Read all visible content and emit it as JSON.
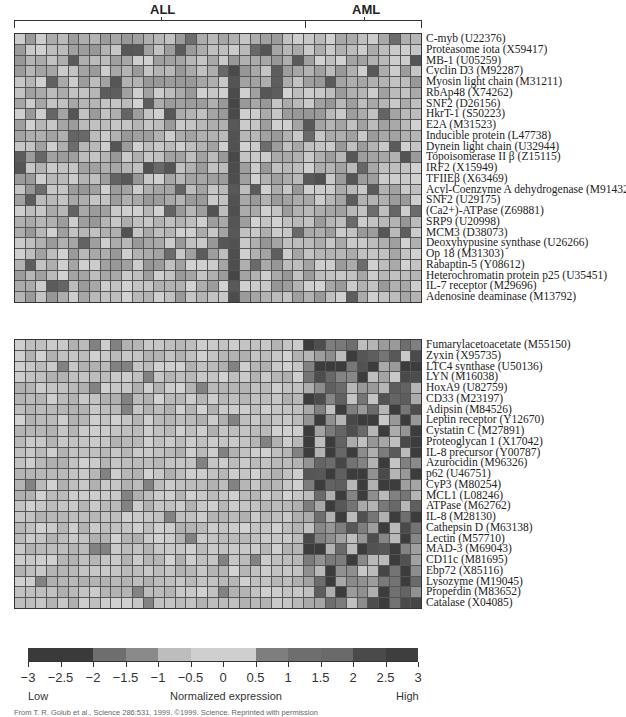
{
  "header": {
    "group_all": "ALL",
    "group_aml": "AML"
  },
  "chart_data": {
    "type": "heatmap",
    "title": "",
    "xlabel": "",
    "ylabel": "",
    "column_groups": [
      {
        "name": "ALL",
        "count": 27
      },
      {
        "name": "AML",
        "count": 11
      }
    ],
    "n_columns": 38,
    "colorbar": {
      "label": "Normalized expression",
      "low_label": "Low",
      "high_label": "High",
      "ticks": [
        "−3",
        "−2.5",
        "−2",
        "−1.5",
        "−1",
        "−0.5",
        "0",
        "0.5",
        "1",
        "1.5",
        "2",
        "2.5",
        "3"
      ],
      "range": [
        -3,
        3
      ],
      "segment_colors": [
        "#3a3a3a",
        "#3a3a3a",
        "#6e6e6e",
        "#8a8a8a",
        "#bdbdbd",
        "#cfcfcf",
        "#cfcfcf",
        "#7e7e7e",
        "#6e6e6e",
        "#6a6a6a",
        "#4a4a4a",
        "#3e3e3e"
      ]
    },
    "blocks": [
      {
        "name": "ALL-high genes",
        "genes": [
          "C-myb (U22376)",
          "Proteasome iota (X59417)",
          "MB-1 (U05259)",
          "Cyclin D3 (M92287)",
          "Myosin light chain (M31211)",
          "RbAp48 (X74262)",
          "SNF2 (D26156)",
          "HkrT-1 (S50223)",
          "E2A (M31523)",
          "Inducible protein (L47738)",
          "Dynein light chain (U32944)",
          "Topoisomerase II β (Z15115)",
          "IRF2 (X15949)",
          "TFIIEβ (X63469)",
          "Acyl-Coenzyme A dehydrogenase (M91432)",
          "SNF2 (U29175)",
          "(Ca2+)-ATPase (Z69881)",
          "SRP9 (U20998)",
          "MCM3 (D38073)",
          "Deoxyhypusine synthase (U26266)",
          "Op 18 (M31303)",
          "Rabaptin-5 (Y08612)",
          "Heterochromatin protein p25 (U35451)",
          "IL-7 receptor (M29696)",
          "Adenosine deaminase (M13792)"
        ]
      },
      {
        "name": "AML-high genes",
        "genes": [
          "Fumarylacetoacetate (M55150)",
          "Zyxin (X95735)",
          "LTC4 synthase (U50136)",
          "LYN (M16038)",
          "HoxA9 (U82759)",
          "CD33 (M23197)",
          "Adipsin (M84526)",
          "Leptin receptor (Y12670)",
          "Cystatin C (M27891)",
          "Proteoglycan 1 (X17042)",
          "IL-8 precursor (Y00787)",
          "Azurocidin (M96326)",
          "p62 (U46751)",
          "CyP3 (M80254)",
          "MCL1 (L08246)",
          "ATPase (M62762)",
          "IL-8 (M28130)",
          "Cathepsin D (M63138)",
          "Lectin (M57710)",
          "MAD-3 (M69043)",
          "CD11c (M81695)",
          "Ebp72 (X85116)",
          "Lysozyme (M19045)",
          "Properdin (M83652)",
          "Catalase (X04085)"
        ]
      }
    ]
  },
  "caption": "From T. R. Golub et al., Science 286:531, 1999. ©1999. Science. Reprinted with permission"
}
